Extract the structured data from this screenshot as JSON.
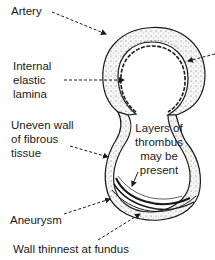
{
  "diagram": {
    "labels": {
      "artery": "Artery",
      "internal_elastic_lamina_1": "Internal",
      "internal_elastic_lamina_2": "elastic",
      "internal_elastic_lamina_3": "lamina",
      "uneven_wall_1": "Uneven wall",
      "uneven_wall_2": "of fibrous",
      "uneven_wall_3": "tissue",
      "thrombus_1": "Layers of",
      "thrombus_2": "thrombus",
      "thrombus_3": "may be",
      "thrombus_4": "present",
      "aneurysm": "Aneurysm",
      "wall_thinnest": "Wall thinnest at fundus"
    },
    "colors": {
      "line": "#1a1a1a",
      "wall_fill": "#f2f2f2",
      "background": "#ffffff"
    }
  }
}
